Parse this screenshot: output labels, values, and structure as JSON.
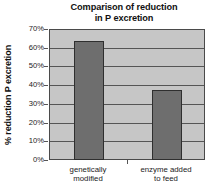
{
  "chart_data": {
    "type": "bar",
    "title": "Comparison of reduction in P excretion",
    "title_lines": [
      "Comparison of reduction",
      "in P excretion"
    ],
    "xlabel": "",
    "ylabel": "% reduction P excretion",
    "categories": [
      "genetically modified",
      "enzyme added to feed"
    ],
    "category_lines": [
      [
        "genetically",
        "modified"
      ],
      [
        "enzyme added",
        "to feed"
      ]
    ],
    "values": [
      64,
      38
    ],
    "ylim": [
      0,
      70
    ],
    "ytick_values": [
      0,
      10,
      20,
      30,
      40,
      50,
      60,
      70
    ],
    "ytick_labels": [
      "0%",
      "10%",
      "20%",
      "30%",
      "40%",
      "50%",
      "60%",
      "70%"
    ],
    "grid": true,
    "legend": false,
    "colors": {
      "bar_fill": "#6e6e6e",
      "bar_edge": "#2f2f2f",
      "plot_background": "#c6c6c6",
      "gridline": "#555555",
      "text": "#1a1a1a",
      "page_background": "#ffffff"
    }
  }
}
